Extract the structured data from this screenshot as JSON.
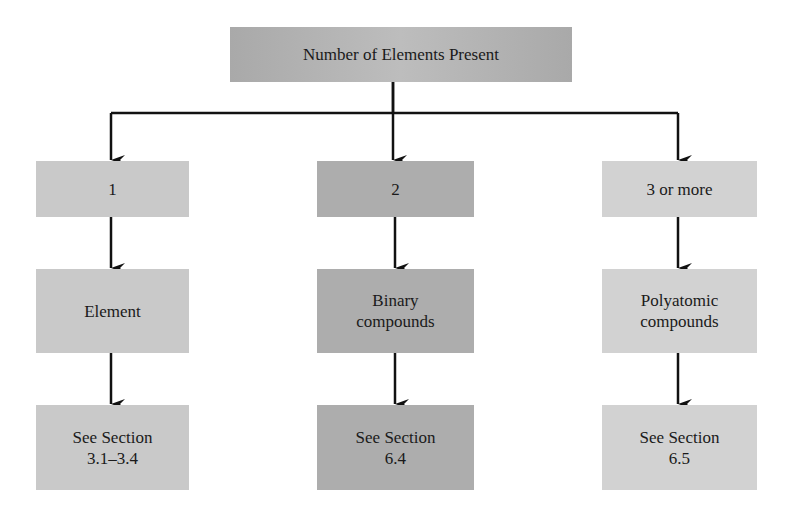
{
  "diagram": {
    "type": "flowchart",
    "root": {
      "label": "Number of Elements Present"
    },
    "columns": [
      {
        "count_label": "1",
        "category": "Element",
        "reference": "See Section 3.1–3.4",
        "reference_line1": "See Section",
        "reference_line2": "3.1–3.4",
        "color": "#c9c9c9"
      },
      {
        "count_label": "2",
        "category": "Binary compounds",
        "category_line1": "Binary",
        "category_line2": "compounds",
        "reference": "See Section 6.4",
        "reference_line1": "See Section",
        "reference_line2": "6.4",
        "color": "#adadad"
      },
      {
        "count_label": "3 or more",
        "category": "Polyatomic compounds",
        "category_line1": "Polyatomic",
        "category_line2": "compounds",
        "reference": "See Section 6.5",
        "reference_line1": "See Section",
        "reference_line2": "6.5",
        "color": "#d2d2d2"
      }
    ],
    "edges": [
      [
        "Number of Elements Present",
        "1"
      ],
      [
        "Number of Elements Present",
        "2"
      ],
      [
        "Number of Elements Present",
        "3 or more"
      ],
      [
        "1",
        "Element"
      ],
      [
        "Element",
        "See Section 3.1–3.4"
      ],
      [
        "2",
        "Binary compounds"
      ],
      [
        "Binary compounds",
        "See Section 6.4"
      ],
      [
        "3 or more",
        "Polyatomic compounds"
      ],
      [
        "Polyatomic compounds",
        "See Section 6.5"
      ]
    ],
    "root_color": "#b3b3b3",
    "line_color": "#111111"
  }
}
